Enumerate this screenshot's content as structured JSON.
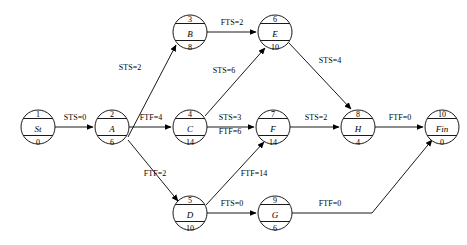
{
  "diagram": {
    "type": "precedence-network",
    "canvas": {
      "width": 467,
      "height": 245,
      "background": "#ffffff",
      "stroke": "#000000"
    },
    "node_geometry": {
      "radius": 17,
      "top_row_y": 32,
      "middle_row_y": 127,
      "bottom_row_y": 213
    },
    "nodes": [
      {
        "key": "st",
        "id": "1",
        "name": "St",
        "duration": "0",
        "cx": 38,
        "cy": 127
      },
      {
        "key": "a",
        "id": "2",
        "name": "A",
        "duration": "6",
        "cx": 112,
        "cy": 127
      },
      {
        "key": "b",
        "id": "3",
        "name": "B",
        "duration": "8",
        "cx": 190,
        "cy": 32
      },
      {
        "key": "c",
        "id": "4",
        "name": "C",
        "duration": "14",
        "cx": 190,
        "cy": 127
      },
      {
        "key": "d",
        "id": "5",
        "name": "D",
        "duration": "10",
        "cx": 190,
        "cy": 213
      },
      {
        "key": "e",
        "id": "6",
        "name": "E",
        "duration": "10",
        "cx": 275,
        "cy": 32
      },
      {
        "key": "f",
        "id": "7",
        "name": "F",
        "duration": "14",
        "cx": 273,
        "cy": 127
      },
      {
        "key": "g",
        "id": "9",
        "name": "G",
        "duration": "6",
        "cx": 275,
        "cy": 213
      },
      {
        "key": "h",
        "id": "8",
        "name": "H",
        "duration": "4",
        "cx": 358,
        "cy": 127
      },
      {
        "key": "fin",
        "id": "10",
        "name": "Fin",
        "duration": "0",
        "cx": 442,
        "cy": 127
      }
    ],
    "edges": [
      {
        "key": "st-a",
        "from": "st",
        "to": "a",
        "label": "STS=0",
        "label_x": 75,
        "label_y": 120
      },
      {
        "key": "a-b",
        "from": "a",
        "to": "b",
        "label": "STS=2",
        "label_x": 130,
        "label_y": 70
      },
      {
        "key": "a-c",
        "from": "a",
        "to": "c",
        "label": "FTF=4",
        "label_x": 151,
        "label_y": 120
      },
      {
        "key": "a-d",
        "from": "a",
        "to": "d",
        "label": "FTF=2",
        "label_x": 155,
        "label_y": 176
      },
      {
        "key": "b-e",
        "from": "b",
        "to": "e",
        "label": "FTS=2",
        "label_x": 232,
        "label_y": 25
      },
      {
        "key": "c-e",
        "from": "c",
        "to": "e",
        "label": "STS=6",
        "label_x": 224,
        "label_y": 73
      },
      {
        "key": "c-f",
        "from": "c",
        "to": "f",
        "label": "STS=3",
        "label_x": 230,
        "label_y": 120
      },
      {
        "key": "c-f2",
        "from": "c",
        "to": "f",
        "label": "FTF=6",
        "label_x": 230,
        "label_y": 134
      },
      {
        "key": "d-f",
        "from": "d",
        "to": "f",
        "label": "FTF=14",
        "label_x": 254,
        "label_y": 176
      },
      {
        "key": "d-g",
        "from": "d",
        "to": "g",
        "label": "FTS=0",
        "label_x": 232,
        "label_y": 206
      },
      {
        "key": "e-h",
        "from": "e",
        "to": "h",
        "label": "STS=4",
        "label_x": 330,
        "label_y": 63
      },
      {
        "key": "f-h",
        "from": "f",
        "to": "h",
        "label": "STS=2",
        "label_x": 316,
        "label_y": 120
      },
      {
        "key": "h-fin",
        "from": "h",
        "to": "fin",
        "label": "FTF=0",
        "label_x": 400,
        "label_y": 120
      },
      {
        "key": "g-fin",
        "from": "g",
        "to": "fin",
        "label": "FTF=0",
        "label_x": 330,
        "label_y": 206
      }
    ]
  }
}
